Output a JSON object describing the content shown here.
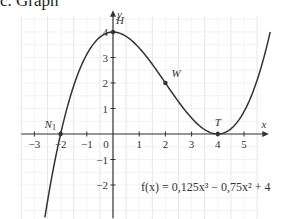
{
  "title": "c. Graph",
  "chart_data": {
    "type": "line",
    "title": "c. Graph",
    "function": "f(x) = 0,125x³ − 0,75x² + 4",
    "coefficients": {
      "a3": 0.125,
      "a2": -0.75,
      "a1": 0,
      "a0": 4
    },
    "xlabel": "x",
    "ylabel": "y",
    "xlim": [
      -3.5,
      5.8
    ],
    "ylim": [
      -3.3,
      4.4
    ],
    "x_ticks": [
      -3,
      -2,
      -1,
      0,
      1,
      2,
      3,
      4,
      5
    ],
    "y_ticks": [
      -2,
      -1,
      1,
      2,
      3,
      4
    ],
    "x_tick_labels": [
      "−3",
      "−2",
      "−1",
      "0",
      "1",
      "2",
      "3",
      "4",
      "5"
    ],
    "y_tick_labels": [
      "−2",
      "−1",
      "1",
      "2",
      "3",
      "4"
    ],
    "grid": true,
    "curve_domain": [
      -2.6,
      6
    ],
    "points": [
      {
        "name": "N1",
        "label": "N",
        "sub": "1",
        "x": -2,
        "y": 0
      },
      {
        "name": "H",
        "label": "H",
        "x": 0,
        "y": 4
      },
      {
        "name": "W",
        "label": "W",
        "x": 2,
        "y": 2
      },
      {
        "name": "T",
        "label": "T",
        "x": 4,
        "y": 0
      }
    ]
  },
  "formula_text": "f(x) = 0,125x³ − 0,75x² + 4"
}
